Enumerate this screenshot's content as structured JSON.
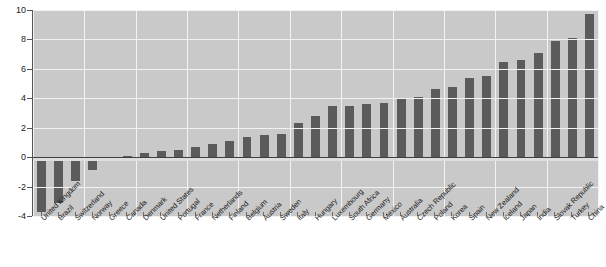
{
  "chart_data": {
    "type": "bar",
    "title": "",
    "xlabel": "",
    "ylabel": "",
    "ylim": [
      -4,
      10
    ],
    "yticks": [
      10,
      8,
      6,
      4,
      2,
      0,
      -2,
      -4
    ],
    "grid": true,
    "legend": "none",
    "bar_color": "#5b5b5b",
    "plot_background": "#c9c9c9",
    "gridline_color": "#f2f2f2",
    "categories": [
      "United Kingdom",
      "Brazil",
      "Switzerland",
      "Norway",
      "Greece",
      "Canada",
      "Denmark",
      "United States",
      "Portugal",
      "France",
      "Netherlands",
      "Finland",
      "Belgium",
      "Austria",
      "Sweden",
      "Italy",
      "Hungary",
      "Luxembourg",
      "South Africa",
      "Germany",
      "Mexico",
      "Australia",
      "Czech Republic",
      "Poland",
      "Korea",
      "Spain",
      "New Zealand",
      "Iceland",
      "Japan",
      "India",
      "Slovak Republic",
      "Turkey",
      "China"
    ],
    "values": [
      -3.7,
      -3.1,
      -1.6,
      -0.9,
      -0.2,
      0.1,
      0.3,
      0.4,
      0.5,
      0.7,
      0.9,
      1.1,
      1.4,
      1.5,
      1.6,
      2.3,
      2.8,
      3.5,
      3.5,
      3.6,
      3.7,
      4.0,
      4.1,
      4.6,
      4.8,
      5.4,
      5.5,
      6.5,
      6.6,
      7.1,
      7.9,
      8.1,
      9.7
    ]
  },
  "axes": {
    "y_tick_labels": [
      "10",
      "8",
      "6",
      "4",
      "2",
      "0",
      "-2",
      "-4"
    ]
  }
}
